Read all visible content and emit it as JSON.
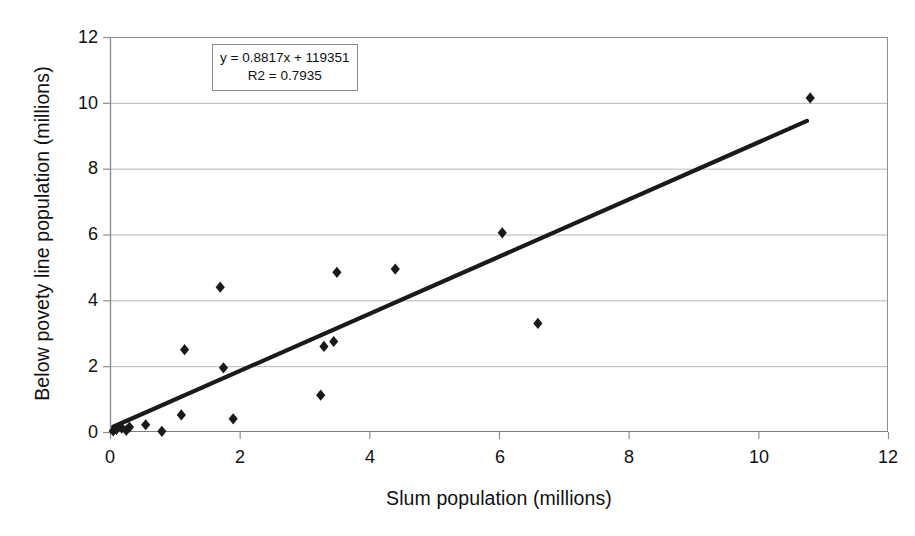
{
  "chart_data": {
    "type": "scatter",
    "title": "",
    "xlabel": "Slum population (millions)",
    "ylabel": "Below povety line population (millions)",
    "xlim": [
      0,
      12
    ],
    "ylim": [
      0,
      12
    ],
    "xticks": [
      0,
      2,
      4,
      6,
      8,
      10,
      12
    ],
    "yticks": [
      0,
      2,
      4,
      6,
      8,
      10,
      12
    ],
    "grid": "horizontal",
    "legend": "none",
    "marker": "diamond",
    "marker_color": "#1a1a1a",
    "points": [
      {
        "x": 0.05,
        "y": 0.03
      },
      {
        "x": 0.1,
        "y": 0.08
      },
      {
        "x": 0.18,
        "y": 0.12
      },
      {
        "x": 0.25,
        "y": 0.05
      },
      {
        "x": 0.3,
        "y": 0.15
      },
      {
        "x": 0.55,
        "y": 0.22
      },
      {
        "x": 0.8,
        "y": 0.02
      },
      {
        "x": 1.1,
        "y": 0.52
      },
      {
        "x": 1.15,
        "y": 2.5
      },
      {
        "x": 1.7,
        "y": 4.4
      },
      {
        "x": 1.75,
        "y": 1.95
      },
      {
        "x": 1.9,
        "y": 0.4
      },
      {
        "x": 3.25,
        "y": 1.12
      },
      {
        "x": 3.3,
        "y": 2.6
      },
      {
        "x": 3.45,
        "y": 2.75
      },
      {
        "x": 3.5,
        "y": 4.85
      },
      {
        "x": 4.4,
        "y": 4.95
      },
      {
        "x": 6.05,
        "y": 6.05
      },
      {
        "x": 6.6,
        "y": 3.3
      },
      {
        "x": 10.8,
        "y": 10.15
      }
    ],
    "trendline": {
      "equation": "y = 0.8817x + 119351",
      "r2_label": "R2 = 0.7935",
      "slope": 0.8817,
      "intercept": 0.119351,
      "r2": 0.7935,
      "x_start": 0.05,
      "y_start": 0.16,
      "x_end": 10.75,
      "y_end": 9.45,
      "color": "#1a1a1a"
    },
    "annotation": {
      "line1": "y = 0.8817x + 119351",
      "line2": "R2 = 0.7935"
    }
  }
}
